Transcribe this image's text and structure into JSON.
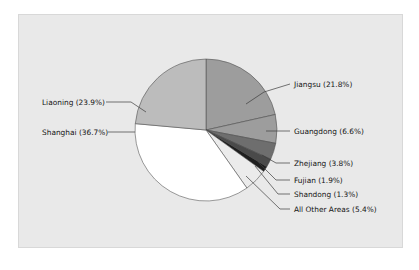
{
  "figure": {
    "background_color": "#ffffff",
    "panel_color": "#e9e9e9",
    "panel_border_color": "#d8d8d8"
  },
  "chart_data": {
    "type": "pie",
    "title": "",
    "subtitle": "",
    "xlabel": "",
    "ylabel": "",
    "legend_position": "none",
    "grid": false,
    "label_format": "{name} ({value}%)",
    "start_angle_deg": 90,
    "direction": "clockwise",
    "center": {
      "x": 206,
      "y": 130
    },
    "radius": 71,
    "categories": [
      "Jiangsu",
      "Guangdong",
      "Zhejiang",
      "Fujian",
      "Shandong",
      "All Other Areas",
      "Shanghai",
      "Liaoning"
    ],
    "values": [
      21.8,
      6.6,
      3.8,
      1.9,
      1.3,
      5.4,
      36.7,
      23.9
    ],
    "colors": [
      "#9d9d9d",
      "#9d9d9d",
      "#6e6e6e",
      "#4a4a4a",
      "#1f1f1f",
      "#ebebeb",
      "#ffffff",
      "#bcbcbc"
    ],
    "slices": [
      {
        "name": "Jiangsu",
        "value": 21.8,
        "label": "Jiangsu (21.8%)",
        "color": "#9d9d9d",
        "label_x": 294,
        "label_y": 87,
        "leader": "M 246 104 L 264 92 L 290 84"
      },
      {
        "name": "Guangdong",
        "value": 6.6,
        "label": "Guangdong (6.6%)",
        "color": "#9d9d9d",
        "label_x": 294,
        "label_y": 134,
        "leader": "M 266 131 L 290 131"
      },
      {
        "name": "Zhejiang",
        "value": 3.8,
        "label": "Zhejiang (3.8%)",
        "color": "#6e6e6e",
        "label_x": 294,
        "label_y": 166,
        "leader": "M 262 155 L 276 163 L 290 163"
      },
      {
        "name": "Fujian",
        "value": 1.9,
        "label": "Fujian (1.9%)",
        "color": "#4a4a4a",
        "label_x": 294,
        "label_y": 183,
        "leader": "M 258 162 L 276 180 L 290 180"
      },
      {
        "name": "Shandong",
        "value": 1.3,
        "label": "Shandong (1.3%)",
        "color": "#1f1f1f",
        "label_x": 294,
        "label_y": 197,
        "leader": "M 255 166 L 278 194 L 290 194"
      },
      {
        "name": "All Other Areas",
        "value": 5.4,
        "label": "All Other Areas (5.4%)",
        "color": "#ebebeb",
        "label_x": 294,
        "label_y": 212,
        "leader": "M 246 176 L 280 209 L 290 209"
      },
      {
        "name": "Shanghai",
        "value": 36.7,
        "label": "Shanghai (36.7%)",
        "color": "#ffffff",
        "label_x": 42,
        "label_y": 135,
        "leader": "M 135 132 L 108 132"
      },
      {
        "name": "Liaoning",
        "value": 23.9,
        "label": "Liaoning (23.9%)",
        "color": "#bcbcbc",
        "label_x": 42,
        "label_y": 105,
        "leader": "M 146 112 L 131 102 L 106 102"
      }
    ]
  }
}
